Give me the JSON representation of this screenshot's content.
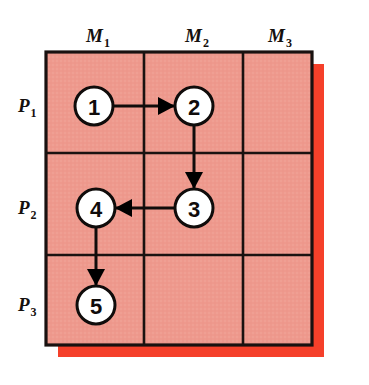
{
  "figure": {
    "kind": "gantt-style machine-process grid with task precedence arrows",
    "canvas": {
      "width": 369,
      "height": 385,
      "background": "#ffffff"
    }
  },
  "colors": {
    "cell_fill": "#ee998d",
    "shadow": "#f5402a",
    "grid_line": "#1a1210",
    "outer_border": "#191110",
    "node_fill": "#ffffff",
    "node_stroke": "#100c0b",
    "arrow": "#100c0b",
    "text": "#15100e"
  },
  "grid": {
    "x": 46,
    "y": 52,
    "width": 266,
    "height": 293,
    "shadow_offset_x": 12,
    "shadow_offset_y": 12,
    "v_dividers": [
      144,
      243
    ],
    "h_dividers": [
      153,
      255
    ],
    "border_width": 3,
    "divider_width": 2.6
  },
  "columns": [
    {
      "id": "M1",
      "base": "M",
      "sub": "1",
      "label": "M₁",
      "cx": 95,
      "label_x": 86,
      "label_y": 42
    },
    {
      "id": "M2",
      "base": "M",
      "sub": "2",
      "label": "M₂",
      "cx": 194,
      "label_x": 185,
      "label_y": 42
    },
    {
      "id": "M3",
      "base": "M",
      "sub": "3",
      "label": "M₃",
      "cx": 277,
      "label_x": 268,
      "label_y": 42
    }
  ],
  "rows": [
    {
      "id": "P1",
      "base": "P",
      "sub": "1",
      "label": "P₁",
      "cy": 106,
      "label_x": 18,
      "label_y": 112
    },
    {
      "id": "P2",
      "base": "P",
      "sub": "2",
      "label": "P₂",
      "cy": 208,
      "label_x": 18,
      "label_y": 214
    },
    {
      "id": "P3",
      "base": "P",
      "sub": "3",
      "label": "P₃",
      "cy": 305,
      "label_x": 18,
      "label_y": 311
    }
  ],
  "nodes": [
    {
      "id": "n1",
      "label": "1",
      "cx": 94,
      "cy": 106,
      "r": 19,
      "row": "P1",
      "column": "M1"
    },
    {
      "id": "n2",
      "label": "2",
      "cx": 194,
      "cy": 106,
      "r": 19,
      "row": "P1",
      "column": "M2"
    },
    {
      "id": "n3",
      "label": "3",
      "cx": 194,
      "cy": 208,
      "r": 19,
      "row": "P2",
      "column": "M2"
    },
    {
      "id": "n4",
      "label": "4",
      "cx": 96,
      "cy": 208,
      "r": 19,
      "row": "P2",
      "column": "M1"
    },
    {
      "id": "n5",
      "label": "5",
      "cx": 96,
      "cy": 305,
      "r": 19,
      "row": "P3",
      "column": "M1"
    }
  ],
  "arrows": [
    {
      "id": "a1",
      "from": "n1",
      "to": "n2",
      "direction": "right",
      "x1": 113,
      "y1": 106,
      "x2": 175,
      "y2": 106
    },
    {
      "id": "a2",
      "from": "n2",
      "to": "n3",
      "direction": "down",
      "x1": 194,
      "y1": 125,
      "x2": 194,
      "y2": 189
    },
    {
      "id": "a3",
      "from": "n3",
      "to": "n4",
      "direction": "left",
      "x1": 175,
      "y1": 208,
      "x2": 115,
      "y2": 208
    },
    {
      "id": "a4",
      "from": "n4",
      "to": "n5",
      "direction": "down",
      "x1": 96,
      "y1": 227,
      "x2": 96,
      "y2": 286
    }
  ],
  "arrowhead": {
    "length": 17,
    "half_width": 9
  }
}
